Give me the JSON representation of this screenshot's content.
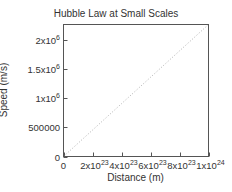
{
  "chart_data": {
    "type": "line",
    "title": "Hubble Law at Small Scales",
    "xlabel": "Distance (m)",
    "ylabel": "Speed (m/s)",
    "xlim": [
      0,
      1e+24
    ],
    "ylim": [
      0,
      2270000
    ],
    "grid": false,
    "legend": null,
    "x_ticks": [
      {
        "value": 0,
        "base": "0",
        "exp": ""
      },
      {
        "value": 2e+23,
        "base": "2x10",
        "exp": "23"
      },
      {
        "value": 4e+23,
        "base": "4x10",
        "exp": "23"
      },
      {
        "value": 6e+23,
        "base": "6x10",
        "exp": "23"
      },
      {
        "value": 8e+23,
        "base": "8x10",
        "exp": "23"
      },
      {
        "value": 1e+24,
        "base": "1x10",
        "exp": "24"
      }
    ],
    "y_ticks": [
      {
        "value": 0,
        "base": "0",
        "exp": ""
      },
      {
        "value": 500000,
        "base": "500000",
        "exp": ""
      },
      {
        "value": 1000000,
        "base": "1x10",
        "exp": "6"
      },
      {
        "value": 1500000,
        "base": "1.5x10",
        "exp": "6"
      },
      {
        "value": 2000000,
        "base": "2x10",
        "exp": "6"
      }
    ],
    "series": [
      {
        "name": "Hubble law v = H0 d",
        "style": "dotted",
        "color": "#b0b0b0",
        "x": [
          0,
          2e+23,
          4e+23,
          6e+23,
          8e+23,
          1e+24
        ],
        "y": [
          0,
          454000,
          908000,
          1362000,
          1816000,
          2270000
        ]
      }
    ]
  },
  "labels": {
    "title": "Hubble Law at Small Scales",
    "xlabel": "Distance (m)",
    "ylabel": "Speed (m/s)"
  }
}
